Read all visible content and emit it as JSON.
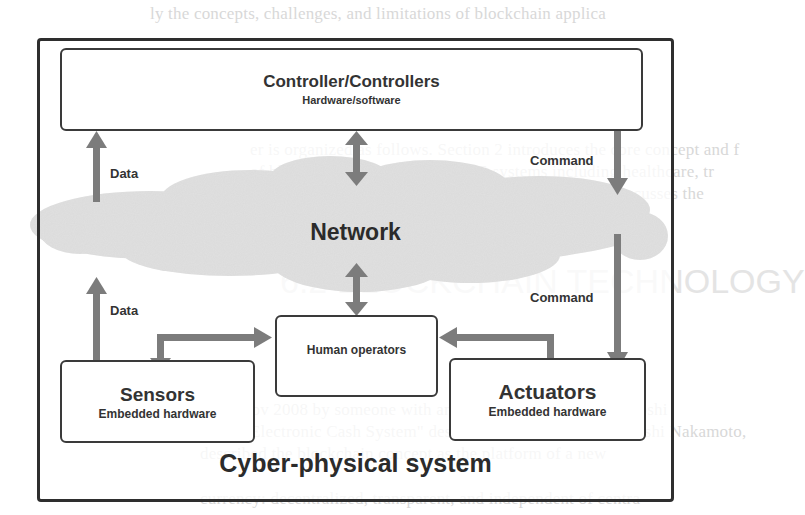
{
  "diagram": {
    "title": "Cyber-physical system",
    "network_label": "Network",
    "nodes": {
      "controller": {
        "title": "Controller/Controllers",
        "subtitle": "Hardware/software"
      },
      "sensors": {
        "title": "Sensors",
        "subtitle": "Embedded hardware"
      },
      "actuators": {
        "title": "Actuators",
        "subtitle": "Embedded hardware"
      },
      "human": {
        "title": "Human operators"
      }
    },
    "edges": {
      "data_upper": "Data",
      "data_lower": "Data",
      "command_upper": "Command",
      "command_lower": "Command"
    },
    "colors": {
      "arrow": "#7a7a7a",
      "cloud": "#d9d9d9",
      "border": "#333333"
    }
  },
  "background_text": {
    "line_top": "ly the concepts, challenges, and limitations of blockchain applica",
    "line_2": "er is organized as follows. Section 2 introduces the core concept and f",
    "line_3": "of blockchain applications in CPS systems including healthcare, tr",
    "line_4": "ses security issues discussed in section 4. Section 5 discusses the",
    "line_5": "re directions and future research directions in this area.",
    "heading": "6.2 BLOCKCHAIN TECHNOLOGY",
    "line_6": "ed in Nov 2008 by someone with anonymous name called \"Satoshi",
    "line_7": "o-Peer Electronic Cash System\" designed by a pseudonym Satoshi Nakamoto,",
    "line_8": "described the blockchain concept as the platform of a new",
    "line_9": "currency: decentralized, transparent, and independent of centra"
  }
}
